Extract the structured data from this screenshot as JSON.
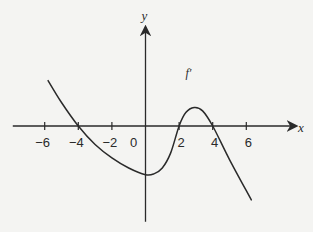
{
  "chart_data": {
    "type": "line",
    "title": "",
    "function_label": "f′",
    "xlabel": "x",
    "ylabel": "y",
    "x_ticks": [
      -6,
      -4,
      -2,
      2,
      4,
      6
    ],
    "x_tick_labels": [
      "−6",
      "−4",
      "−2",
      "2",
      "4",
      "6"
    ],
    "origin_label": "0",
    "xlim": [
      -7.9,
      9.0
    ],
    "ylim": [
      -5.7,
      5.8
    ],
    "grid": false,
    "legend": "none",
    "series": [
      {
        "name": "f′",
        "points": [
          [
            -5.8,
            2.7
          ],
          [
            -5.0,
            1.4
          ],
          [
            -4.0,
            0.0
          ],
          [
            -3.0,
            -1.1
          ],
          [
            -2.0,
            -1.9
          ],
          [
            -1.0,
            -2.5
          ],
          [
            0.0,
            -2.9
          ],
          [
            0.5,
            -2.85
          ],
          [
            1.0,
            -2.5
          ],
          [
            1.5,
            -1.6
          ],
          [
            2.0,
            0.0
          ],
          [
            2.4,
            0.8
          ],
          [
            2.9,
            1.1
          ],
          [
            3.4,
            0.9
          ],
          [
            4.0,
            0.0
          ],
          [
            5.0,
            -2.0
          ],
          [
            6.3,
            -4.4
          ]
        ]
      }
    ],
    "zeros": [
      -4,
      2,
      4
    ],
    "annotations": [
      {
        "text": "f′",
        "x": 2.5,
        "y": 3.2
      }
    ]
  },
  "colors": {
    "background": "#f4f4f2",
    "ink": "#2a2a2a"
  }
}
